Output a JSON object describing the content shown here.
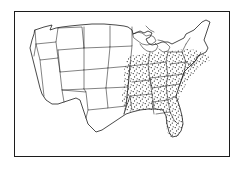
{
  "figure": {
    "title": "United States map with stippled region",
    "type": "choropleth-stipple-map",
    "frame": {
      "visible": true,
      "x": 14,
      "y": 11,
      "width": 216,
      "height": 146,
      "stroke": "#1c1c1c",
      "stroke_width": 1.5
    },
    "background_color": "#ffffff",
    "outline_color": "#1c1c1c",
    "stipple_color": "#111111"
  },
  "map_data": {
    "type": "map",
    "projection": "contiguous-united-states",
    "shading": {
      "pattern": "stipple-dots",
      "dot_color": "#111111",
      "dot_radius": 0.55,
      "description": "Random dot stipple fill marking the shaded region"
    },
    "legend": {
      "visible": false,
      "entries": []
    },
    "labels": {
      "visible": false,
      "entries": []
    },
    "regions_shaded": [
      "Missouri",
      "Arkansas",
      "Louisiana",
      "Mississippi",
      "Alabama",
      "Tennessee",
      "Kentucky",
      "Illinois",
      "Indiana",
      "Ohio",
      "West Virginia",
      "Virginia",
      "North Carolina",
      "South Carolina",
      "Georgia",
      "Florida",
      "Maryland",
      "Delaware",
      "Pennsylvania-south"
    ],
    "regions_unshaded": [
      "Washington",
      "Oregon",
      "California",
      "Nevada",
      "Idaho",
      "Montana",
      "Wyoming",
      "Utah",
      "Arizona",
      "Colorado",
      "New Mexico",
      "Texas",
      "Oklahoma",
      "Kansas",
      "Nebraska",
      "South Dakota",
      "North Dakota",
      "Minnesota",
      "Iowa",
      "Wisconsin",
      "Michigan",
      "New York",
      "Vermont",
      "New Hampshire",
      "Maine",
      "Massachusetts",
      "Connecticut",
      "Rhode Island",
      "New Jersey"
    ],
    "features_drawn": [
      "state-boundaries",
      "national-outline",
      "great-lakes",
      "frame-border"
    ]
  }
}
